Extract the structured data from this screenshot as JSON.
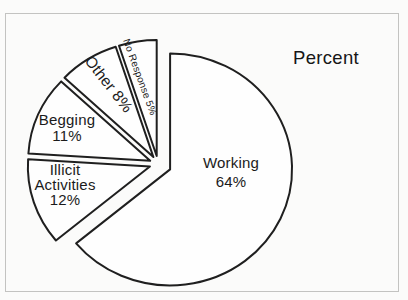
{
  "page": {
    "background": "#fbfbfa",
    "frame_color": "#c3c3c1"
  },
  "chart_data": {
    "type": "pie",
    "title": "Percent",
    "unit": "%",
    "legend": "none",
    "labels_on_slices": true,
    "categories": [
      "Working",
      "Illicit Activities",
      "Begging",
      "Other",
      "No Response"
    ],
    "values": [
      64,
      12,
      11,
      8,
      5
    ],
    "slices": [
      {
        "name": "Working",
        "slug": "working",
        "value": 64,
        "explode": 0.11,
        "label_lines": [
          "Working",
          "64%"
        ],
        "label_x": 231,
        "label_y": 172,
        "label_rotate": 0,
        "label_size": 15,
        "line_height": 19
      },
      {
        "name": "Illicit Activities",
        "slug": "illicit-activities",
        "value": 12,
        "explode": 0.07,
        "label_lines": [
          "Illicit",
          "Activities",
          "12%"
        ],
        "label_x": 65,
        "label_y": 184,
        "label_rotate": 0,
        "label_size": 15,
        "line_height": 15
      },
      {
        "name": "Begging",
        "slug": "begging",
        "value": 11,
        "explode": 0.07,
        "label_lines": [
          "Begging",
          "11%"
        ],
        "label_x": 67,
        "label_y": 127,
        "label_rotate": 0,
        "label_size": 15,
        "line_height": 16
      },
      {
        "name": "Other",
        "slug": "other",
        "value": 8,
        "explode": 0.07,
        "label_lines": [
          "Other 8%"
        ],
        "label_x": 109,
        "label_y": 84,
        "label_rotate": 52,
        "label_size": 15.5,
        "line_height": 16
      },
      {
        "name": "No Response",
        "slug": "no-response",
        "value": 5,
        "explode": 0.07,
        "label_lines": [
          "No Response 5%"
        ],
        "label_x": 140,
        "label_y": 77,
        "label_rotate": 70,
        "label_size": 10,
        "line_height": 12
      }
    ],
    "layout": {
      "cx": 158,
      "cy": 164,
      "rx": 122,
      "ry": 116,
      "start_angle_deg": 90,
      "direction": "clockwise",
      "slice_fill": "#fefefe",
      "slice_stroke": "#1f1f1f",
      "stroke_width": 2
    }
  }
}
